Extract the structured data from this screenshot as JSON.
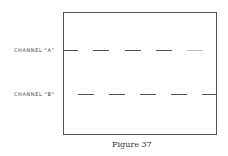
{
  "diagram": {
    "channels": [
      {
        "label": "CHANNEL \"A\"",
        "y": 50,
        "dashes": [
          [
            63,
            78
          ],
          [
            93,
            109
          ],
          [
            125,
            141
          ],
          [
            156,
            172
          ],
          [
            187,
            203
          ]
        ],
        "faint_last": true
      },
      {
        "label": "CHANNEL \"B\"",
        "y": 94,
        "dashes": [
          [
            78,
            94
          ],
          [
            109,
            125
          ],
          [
            140,
            156
          ],
          [
            171,
            187
          ],
          [
            202,
            217
          ]
        ],
        "faint_last": false
      }
    ],
    "caption": "Figure 37"
  }
}
